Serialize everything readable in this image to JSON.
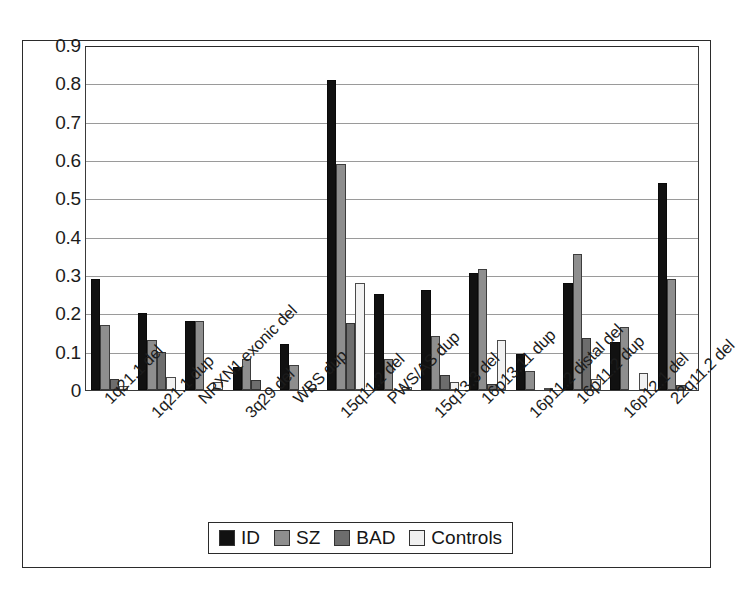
{
  "chart_data": {
    "type": "bar",
    "title": "",
    "subtitle": "",
    "xlabel": "",
    "ylabel": "",
    "ylim": [
      0,
      0.9
    ],
    "ytick_labels": [
      "0.9",
      "0.8",
      "0.7",
      "0.6",
      "0.5",
      "0.4",
      "0.3",
      "0.2",
      "0.1",
      "0"
    ],
    "ytick_values": [
      0.9,
      0.8,
      0.7,
      0.6,
      0.5,
      0.4,
      0.3,
      0.2,
      0.1,
      0
    ],
    "grid": true,
    "grid_axis": "y",
    "legend_position": "bottom-center",
    "categories": [
      "1q21.1 del",
      "1q21.1 dup",
      "NRXN1 exonic del",
      "3q29 del",
      "WBS dup",
      "15q11.2 del",
      "PWS/AS dup",
      "15q13.3 del",
      "16p13.11 dup",
      "16p11.2 distal del",
      "16p11.2 dup",
      "16p12.1 del",
      "22q11.2 del"
    ],
    "series": [
      {
        "name": "ID",
        "color": "#111111",
        "values": [
          0.29,
          0.2,
          0.18,
          0.06,
          0.12,
          0.81,
          0.25,
          0.26,
          0.305,
          0.095,
          0.28,
          0.125,
          0.54
        ]
      },
      {
        "name": "SZ",
        "color": "#8e8e8e",
        "values": [
          0.17,
          0.13,
          0.18,
          0.08,
          0.065,
          0.59,
          0.08,
          0.14,
          0.315,
          0.05,
          0.355,
          0.165,
          0.29
        ]
      },
      {
        "name": "BAD",
        "color": "#6d6d6d",
        "values": [
          0.03,
          0.1,
          0.0,
          0.025,
          0.0,
          0.175,
          0.0,
          0.04,
          0.015,
          0.0,
          0.135,
          0.0,
          0.012
        ]
      },
      {
        "name": "Controls",
        "color": "#f0f0f0",
        "values": [
          0.01,
          0.035,
          0.02,
          0.0,
          0.005,
          0.28,
          0.007,
          0.02,
          0.13,
          0.005,
          0.03,
          0.045,
          0.0
        ]
      }
    ]
  },
  "legend": {
    "items": [
      {
        "label": "ID",
        "swatch": "s-id"
      },
      {
        "label": "SZ",
        "swatch": "s-sz"
      },
      {
        "label": "BAD",
        "swatch": "s-bad"
      },
      {
        "label": "Controls",
        "swatch": "s-controls"
      }
    ]
  }
}
